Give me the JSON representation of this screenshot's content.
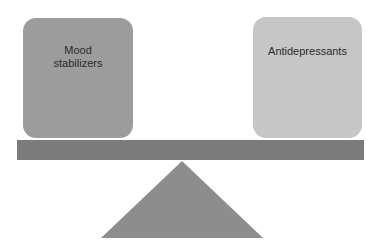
{
  "diagram": {
    "type": "balance-scale",
    "left_pan": {
      "label": "Mood stabilizers",
      "color": "#9c9c9c"
    },
    "right_pan": {
      "label": "Antidepressants",
      "color": "#c6c6c6"
    },
    "beam": {
      "color": "#7b7b7b"
    },
    "fulcrum": {
      "color": "#8d8d8d"
    }
  }
}
